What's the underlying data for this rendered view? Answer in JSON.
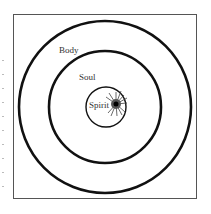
{
  "diagram": {
    "labels": {
      "outer": "Body",
      "middle": "Soul",
      "inner": "Spirit"
    },
    "colors": {
      "stroke": "#111111",
      "frame": "#555555",
      "burst": "#222222"
    }
  }
}
